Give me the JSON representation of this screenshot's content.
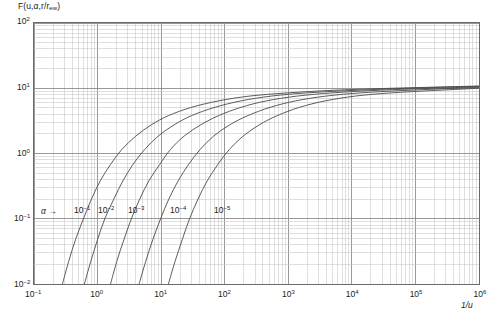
{
  "figure": {
    "y_axis_title_prefix": "F(",
    "y_axis_title": "F(u,α,r/r",
    "y_axis_title_sub": "ew",
    "y_axis_title_suffix": ")",
    "x_axis_title": "1/u",
    "alpha_annotation": "α",
    "alpha_arrow": "→",
    "caption": "",
    "frame_color": "#6a6a6a",
    "grid_major_color": "#8c8c8c",
    "grid_minor_color": "#c4c4c4",
    "curve_color": "#4a4a4a",
    "background_color": "#ffffff"
  },
  "chart_data": {
    "type": "line",
    "title": "",
    "xlabel": "1/u",
    "ylabel": "F(u,α,r/r_ew)",
    "xscale": "log",
    "yscale": "log",
    "xlim": [
      0.1,
      1000000
    ],
    "ylim": [
      0.01,
      100
    ],
    "grid": true,
    "grid_style": "log-log major and minor gridlines",
    "legend": "inline curve labels near lower-left of each curve",
    "x_tick_labels": [
      "10-1",
      "100",
      "101",
      "102",
      "103",
      "104",
      "105",
      "106"
    ],
    "y_tick_labels": [
      "10-2",
      "10-1",
      "100",
      "101",
      "102"
    ],
    "x_tick_exponents": [
      -1,
      0,
      1,
      2,
      3,
      4,
      5,
      6
    ],
    "y_tick_exponents": [
      -2,
      -1,
      0,
      1,
      2
    ],
    "annotations": [
      {
        "text": "α →",
        "x_px": 44,
        "y_px": 211,
        "meaning": "alpha parameter increases to the right"
      }
    ],
    "series": [
      {
        "name": "10-1",
        "alpha": 0.1,
        "label": "10",
        "label_exp": "-1",
        "label_x_px": 74,
        "label_y_px": 211,
        "x": [
          0.28,
          0.35,
          0.45,
          0.6,
          0.8,
          1.1,
          1.6,
          2.4,
          4,
          7,
          13,
          30,
          80,
          250,
          1000,
          5000,
          30000,
          200000,
          1000000
        ],
        "y": [
          0.01,
          0.022,
          0.048,
          0.1,
          0.2,
          0.38,
          0.68,
          1.15,
          1.85,
          2.75,
          3.8,
          5.1,
          6.4,
          7.6,
          8.5,
          9.3,
          9.9,
          10.4,
          10.8
        ]
      },
      {
        "name": "10-2",
        "alpha": 0.01,
        "label": "10",
        "label_exp": "-2",
        "label_x_px": 98,
        "label_y_px": 211,
        "x": [
          0.62,
          0.78,
          1.0,
          1.3,
          1.8,
          2.5,
          3.6,
          5.5,
          9,
          16,
          30,
          70,
          180,
          550,
          2000,
          9000,
          50000,
          300000,
          1000000
        ],
        "y": [
          0.01,
          0.022,
          0.048,
          0.1,
          0.2,
          0.38,
          0.68,
          1.15,
          1.85,
          2.75,
          3.8,
          5.1,
          6.4,
          7.6,
          8.5,
          9.2,
          9.85,
          10.4,
          10.7
        ]
      },
      {
        "name": "10-3",
        "alpha": 0.001,
        "label": "10",
        "label_exp": "-3",
        "label_x_px": 128,
        "label_y_px": 211,
        "x": [
          1.6,
          2.0,
          2.6,
          3.4,
          4.6,
          6.4,
          9.5,
          14,
          23,
          42,
          80,
          180,
          450,
          1400,
          5000,
          20000,
          100000,
          500000,
          1000000
        ],
        "y": [
          0.01,
          0.022,
          0.048,
          0.1,
          0.2,
          0.38,
          0.68,
          1.15,
          1.85,
          2.75,
          3.8,
          5.1,
          6.4,
          7.6,
          8.5,
          9.2,
          9.8,
          10.3,
          10.55
        ]
      },
      {
        "name": "10-4",
        "alpha": 0.0001,
        "label": "10",
        "label_exp": "-4",
        "label_x_px": 170,
        "label_y_px": 211,
        "x": [
          4.5,
          5.7,
          7.4,
          9.8,
          13.2,
          18.5,
          27,
          41,
          67,
          120,
          230,
          520,
          1300,
          4000,
          14000,
          60000,
          300000,
          1000000
        ],
        "y": [
          0.01,
          0.022,
          0.048,
          0.1,
          0.2,
          0.38,
          0.68,
          1.15,
          1.85,
          2.75,
          3.8,
          5.1,
          6.4,
          7.6,
          8.5,
          9.2,
          9.85,
          10.35
        ]
      },
      {
        "name": "10-5",
        "alpha": 1e-05,
        "label": "10",
        "label_exp": "-5",
        "label_x_px": 214,
        "label_y_px": 211,
        "x": [
          13,
          16.5,
          21.5,
          28,
          38,
          53,
          78,
          118,
          195,
          350,
          670,
          1500,
          3800,
          11500,
          42000,
          180000,
          800000,
          1000000
        ],
        "y": [
          0.01,
          0.022,
          0.048,
          0.1,
          0.2,
          0.38,
          0.68,
          1.15,
          1.85,
          2.75,
          3.8,
          5.1,
          6.4,
          7.6,
          8.5,
          9.2,
          9.9,
          10.05
        ]
      }
    ],
    "envelope_note": "All curves converge toward the Theis-type upper envelope approaching F ≈ 11 at 1/u = 10^6"
  }
}
